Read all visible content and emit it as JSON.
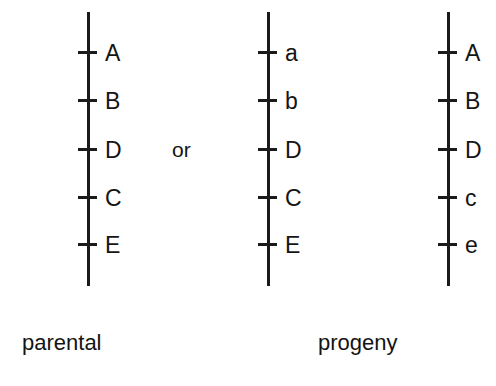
{
  "figure": {
    "type": "genetic-linkage-map",
    "background_color": "#ffffff",
    "line_color": "#1a1a1a",
    "text_color": "#141414"
  },
  "conjunction": {
    "text": "or"
  },
  "captions": {
    "parental": "parental",
    "progeny": "progeny"
  },
  "chromosomes": [
    {
      "id": "parental-chromosome",
      "group": "parental",
      "loci": [
        {
          "label": "A"
        },
        {
          "label": "B"
        },
        {
          "label": "D"
        },
        {
          "label": "C"
        },
        {
          "label": "E"
        }
      ]
    },
    {
      "id": "progeny-chromosome-1",
      "group": "progeny",
      "loci": [
        {
          "label": "a"
        },
        {
          "label": "b"
        },
        {
          "label": "D"
        },
        {
          "label": "C"
        },
        {
          "label": "E"
        }
      ]
    },
    {
      "id": "progeny-chromosome-2",
      "group": "progeny",
      "loci": [
        {
          "label": "A"
        },
        {
          "label": "B"
        },
        {
          "label": "D"
        },
        {
          "label": "c"
        },
        {
          "label": "e"
        }
      ]
    }
  ]
}
